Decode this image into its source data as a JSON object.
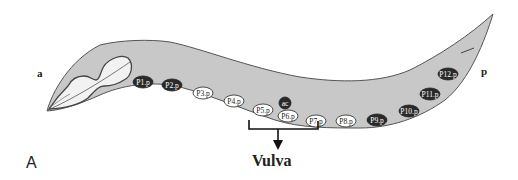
{
  "figure": {
    "panel_label": "A",
    "anterior_label": "a",
    "posterior_label": "p",
    "vulva_label": "Vulva"
  },
  "colors": {
    "body_fill": "#c8c8c8",
    "outline": "#555555",
    "dark_cell": "#2a2a2a",
    "light_cell": "#ffffff"
  },
  "cells": [
    {
      "id": "P1.p",
      "label": "P1.p",
      "x": 143,
      "y": 82,
      "style": "dark"
    },
    {
      "id": "P2.p",
      "label": "P2.p",
      "x": 172,
      "y": 85,
      "style": "dark"
    },
    {
      "id": "P3.p",
      "label": "P3.p",
      "x": 203,
      "y": 93,
      "style": "light"
    },
    {
      "id": "P4.p",
      "label": "P4.p",
      "x": 234,
      "y": 101,
      "style": "light"
    },
    {
      "id": "P5.p",
      "label": "P5.p",
      "x": 263,
      "y": 110,
      "style": "light"
    },
    {
      "id": "ac",
      "label": "ac",
      "x": 285,
      "y": 103,
      "style": "dark-small"
    },
    {
      "id": "P6.p",
      "label": "P6.p",
      "x": 288,
      "y": 116,
      "style": "light"
    },
    {
      "id": "P7.p",
      "label": "P7.p",
      "x": 316,
      "y": 121,
      "style": "light"
    },
    {
      "id": "P8.p",
      "label": "P8.p",
      "x": 346,
      "y": 121,
      "style": "light"
    },
    {
      "id": "P9.p",
      "label": "P9.p",
      "x": 377,
      "y": 120,
      "style": "dark"
    },
    {
      "id": "P10.p",
      "label": "P10.p",
      "x": 409,
      "y": 111,
      "style": "dark"
    },
    {
      "id": "P11.p",
      "label": "P11.p",
      "x": 430,
      "y": 94,
      "style": "dark"
    },
    {
      "id": "P12.p",
      "label": "P12.p",
      "x": 448,
      "y": 74,
      "style": "dark"
    }
  ]
}
